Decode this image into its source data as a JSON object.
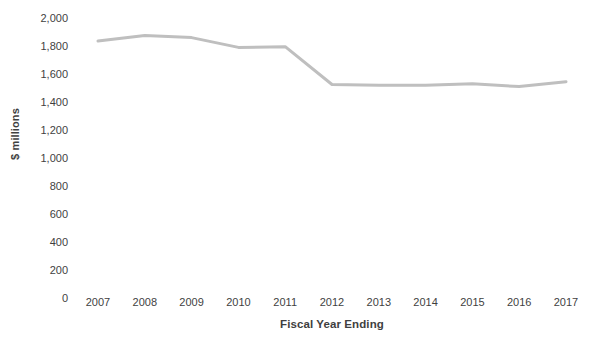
{
  "chart_data": {
    "type": "line",
    "title": "",
    "xlabel": "Fiscal Year Ending",
    "ylabel": "$ millions",
    "categories": [
      "2007",
      "2008",
      "2009",
      "2010",
      "2011",
      "2012",
      "2013",
      "2014",
      "2015",
      "2016",
      "2017"
    ],
    "values": [
      1835,
      1875,
      1860,
      1790,
      1795,
      1525,
      1520,
      1520,
      1530,
      1510,
      1545
    ],
    "series": [
      {
        "name": "$ millions",
        "values": [
          1835,
          1875,
          1860,
          1790,
          1795,
          1525,
          1520,
          1520,
          1530,
          1510,
          1545
        ]
      }
    ],
    "ylim": [
      0,
      2000
    ],
    "ytick_values": [
      0,
      200,
      400,
      600,
      800,
      1000,
      1200,
      1400,
      1600,
      1800,
      2000
    ],
    "ytick_labels": [
      "0",
      "200",
      "400",
      "600",
      "800",
      "1,000",
      "1,200",
      "1,400",
      "1,600",
      "1,800",
      "2,000"
    ],
    "grid": false,
    "legend": "none",
    "line_color": "#bfbfbf",
    "line_width": 3,
    "markers": false,
    "axis_text_color": "#3f3f3f",
    "background_color": "#ffffff"
  },
  "caption": {
    "remnant_text": ""
  }
}
